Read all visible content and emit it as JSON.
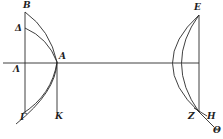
{
  "diagram": {
    "type": "geometric-figure",
    "style": "black-and-white engraving",
    "left_figure": {
      "labels": {
        "B": "B",
        "Delta": "Δ",
        "A": "A",
        "Lambda": "Λ",
        "Gamma": "Γ",
        "K": "K"
      }
    },
    "right_figure": {
      "labels": {
        "E": "E",
        "Z": "Z",
        "H": "Η",
        "Theta": "Θ"
      }
    }
  }
}
